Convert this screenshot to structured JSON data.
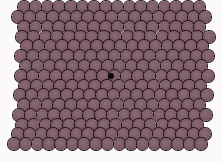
{
  "image": {
    "description": "Photograph of a hexagonally close-packed raft of spheres (bubble raft / crystal lattice model) with a point defect near the center",
    "background_color": "#fbfaf8",
    "sphere_color": "#7b5c66",
    "outline_color": "#241216"
  },
  "lattice": {
    "diameter": 11.6,
    "pitch_x": 11.7,
    "pitch_y": 9.8,
    "rows": [
      {
        "y": 7,
        "x0": 24,
        "count": 16
      },
      {
        "y": 17,
        "x0": 18,
        "count": 17
      },
      {
        "y": 27,
        "x0": 24,
        "count": 16
      },
      {
        "y": 37,
        "x0": 22,
        "count": 17
      },
      {
        "y": 46,
        "x0": 27,
        "count": 16
      },
      {
        "y": 56,
        "x0": 21,
        "count": 17
      },
      {
        "y": 66,
        "x0": 26,
        "count": 16
      },
      {
        "y": 76,
        "x0": 21,
        "count": 17
      },
      {
        "y": 86,
        "x0": 25,
        "count": 16
      },
      {
        "y": 95,
        "x0": 20,
        "count": 17
      },
      {
        "y": 105,
        "x0": 24,
        "count": 16
      },
      {
        "y": 115,
        "x0": 19,
        "count": 17
      },
      {
        "y": 125,
        "x0": 22,
        "count": 16
      },
      {
        "y": 134,
        "x0": 18,
        "count": 17
      },
      {
        "y": 144,
        "x0": 14,
        "count": 17
      }
    ],
    "defect": {
      "x": 111,
      "y": 76,
      "r": 3
    }
  }
}
